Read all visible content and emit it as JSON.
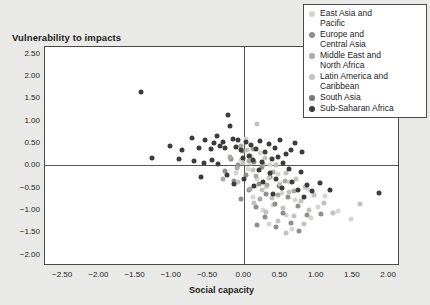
{
  "chart_data": {
    "type": "scatter",
    "title": "Vulnerability to impacts",
    "xlabel": "Social capacity",
    "ylabel": "Vulnerability to impacts",
    "xlim": [
      -2.75,
      2.15
    ],
    "ylim": [
      -2.25,
      2.65
    ],
    "xticks": [
      "-2.50",
      "-2.00",
      "-1.50",
      "-1.00",
      "-0.50",
      "0.00",
      "0.50",
      "1.00",
      "1.50",
      "2.00"
    ],
    "xtick_values": [
      -2.5,
      -2.0,
      -1.5,
      -1.0,
      -0.5,
      0.0,
      0.5,
      1.0,
      1.5,
      2.0
    ],
    "yticks": [
      "2.50",
      "2.00",
      "1.50",
      "1.00",
      "0.50",
      "0.00",
      "-0.50",
      "-1.00",
      "-1.50",
      "-2.00"
    ],
    "ytick_values": [
      2.5,
      2.0,
      1.5,
      1.0,
      0.5,
      0.0,
      -0.5,
      -1.0,
      -1.5,
      -2.0
    ],
    "grid": false,
    "zero_lines": true,
    "legend_position": "top-right",
    "series": [
      {
        "name": "East Asia and Pacific",
        "color": "#d5d5d3",
        "points": [
          [
            0.02,
            0.6
          ],
          [
            0.22,
            0.28
          ],
          [
            -0.05,
            0.12
          ],
          [
            0.1,
            0.05
          ],
          [
            0.35,
            0.02
          ],
          [
            0.05,
            -0.08
          ],
          [
            -0.12,
            -0.18
          ],
          [
            0.46,
            -0.2
          ],
          [
            0.18,
            -0.3
          ],
          [
            0.62,
            -0.38
          ],
          [
            0.3,
            -0.48
          ],
          [
            0.88,
            -0.52
          ],
          [
            0.52,
            -0.62
          ],
          [
            0.12,
            -0.7
          ],
          [
            0.7,
            -0.78
          ],
          [
            0.4,
            -0.88
          ],
          [
            1.02,
            -0.92
          ],
          [
            0.26,
            -1.0
          ],
          [
            0.58,
            -1.1
          ],
          [
            0.92,
            -1.18
          ],
          [
            1.3,
            -1.02
          ],
          [
            0.34,
            -1.3
          ],
          [
            0.66,
            -1.42
          ],
          [
            1.12,
            -0.68
          ],
          [
            1.48,
            -1.2
          ]
        ]
      },
      {
        "name": "Europe and Central Asia",
        "color": "#8e8e8c",
        "points": [
          [
            -0.02,
            0.32
          ],
          [
            0.08,
            0.22
          ],
          [
            -0.18,
            0.14
          ],
          [
            0.14,
            0.08
          ],
          [
            -0.08,
            0.0
          ],
          [
            0.24,
            -0.04
          ],
          [
            -0.26,
            -0.12
          ],
          [
            0.02,
            -0.22
          ],
          [
            0.36,
            -0.26
          ],
          [
            -0.14,
            -0.34
          ],
          [
            0.2,
            -0.42
          ],
          [
            0.48,
            -0.46
          ],
          [
            0.06,
            -0.56
          ],
          [
            0.3,
            -0.64
          ],
          [
            -0.05,
            -0.74
          ],
          [
            0.6,
            -0.7
          ],
          [
            0.42,
            -0.86
          ],
          [
            0.16,
            -0.94
          ],
          [
            0.74,
            -0.9
          ],
          [
            0.54,
            -1.06
          ],
          [
            0.28,
            -1.16
          ],
          [
            0.86,
            -1.12
          ],
          [
            0.64,
            -1.28
          ],
          [
            0.44,
            -1.38
          ],
          [
            1.06,
            -1.08
          ],
          [
            0.76,
            -1.46
          ],
          [
            0.18,
            -1.34
          ]
        ]
      },
      {
        "name": "Middle East and North Africa",
        "color": "#a9a9a7",
        "points": [
          [
            -0.04,
            0.44
          ],
          [
            0.12,
            0.36
          ],
          [
            -0.2,
            0.2
          ],
          [
            0.06,
            0.1
          ],
          [
            0.26,
            0.04
          ],
          [
            -0.1,
            -0.06
          ],
          [
            0.4,
            -0.14
          ],
          [
            0.16,
            -0.24
          ],
          [
            -0.3,
            -0.3
          ],
          [
            0.56,
            -0.34
          ],
          [
            0.32,
            -0.44
          ],
          [
            0.08,
            -0.52
          ],
          [
            0.68,
            -0.58
          ],
          [
            0.46,
            -0.66
          ],
          [
            0.22,
            -0.76
          ]
        ]
      },
      {
        "name": "Latin America and Caribbean",
        "color": "#c2c2c0",
        "points": [
          [
            0.18,
            0.92
          ],
          [
            0.04,
            0.34
          ],
          [
            0.28,
            0.16
          ],
          [
            -0.02,
            0.06
          ],
          [
            0.44,
            0.0
          ],
          [
            0.12,
            -0.1
          ],
          [
            0.58,
            -0.16
          ],
          [
            0.34,
            -0.28
          ],
          [
            -0.08,
            -0.36
          ],
          [
            0.72,
            -0.3
          ],
          [
            0.5,
            -0.42
          ],
          [
            0.24,
            -0.54
          ],
          [
            0.84,
            -0.48
          ],
          [
            0.62,
            -0.6
          ],
          [
            0.38,
            -0.72
          ],
          [
            0.96,
            -0.66
          ],
          [
            0.14,
            -0.84
          ],
          [
            0.78,
            -0.8
          ],
          [
            0.54,
            -0.96
          ],
          [
            1.1,
            -0.84
          ],
          [
            0.3,
            -1.04
          ],
          [
            0.9,
            -1.0
          ],
          [
            0.68,
            -1.14
          ],
          [
            0.46,
            -1.24
          ],
          [
            1.22,
            -1.06
          ],
          [
            0.82,
            -1.32
          ],
          [
            1.6,
            -0.86
          ],
          [
            0.58,
            -1.52
          ]
        ]
      },
      {
        "name": "South Asia",
        "color": "#757573"
      },
      {
        "name": "Sub-Saharan Africa",
        "color": "#3c3c3a",
        "points": [
          [
            -1.42,
            1.64
          ],
          [
            -0.22,
            1.12
          ],
          [
            -0.2,
            0.88
          ],
          [
            -0.72,
            0.62
          ],
          [
            -0.54,
            0.58
          ],
          [
            -0.38,
            0.66
          ],
          [
            -0.3,
            0.52
          ],
          [
            -0.42,
            0.5
          ],
          [
            -1.02,
            0.44
          ],
          [
            -0.86,
            0.34
          ],
          [
            -0.16,
            0.6
          ],
          [
            -0.08,
            0.56
          ],
          [
            0.02,
            0.52
          ],
          [
            -0.26,
            0.4
          ],
          [
            -0.34,
            0.44
          ],
          [
            -0.46,
            0.36
          ],
          [
            -0.62,
            0.4
          ],
          [
            -0.12,
            0.42
          ],
          [
            0.1,
            0.46
          ],
          [
            0.22,
            0.54
          ],
          [
            -0.04,
            0.34
          ],
          [
            0.16,
            0.36
          ],
          [
            0.34,
            0.48
          ],
          [
            0.42,
            0.4
          ],
          [
            0.28,
            0.3
          ],
          [
            -0.7,
            0.1
          ],
          [
            -0.56,
            0.06
          ],
          [
            -0.9,
            0.14
          ],
          [
            -1.28,
            0.16
          ],
          [
            -0.44,
            0.12
          ],
          [
            -0.36,
            0.04
          ],
          [
            -0.6,
            -0.26
          ],
          [
            -0.24,
            -0.22
          ],
          [
            0.06,
            0.22
          ],
          [
            0.5,
            0.58
          ],
          [
            0.58,
            0.26
          ],
          [
            0.46,
            0.18
          ],
          [
            0.64,
            0.34
          ],
          [
            0.7,
            0.5
          ],
          [
            0.8,
            0.3
          ],
          [
            0.12,
            0.12
          ],
          [
            -0.02,
            0.16
          ],
          [
            0.24,
            0.08
          ],
          [
            0.38,
            0.14
          ],
          [
            0.54,
            0.06
          ],
          [
            0.2,
            -0.1
          ],
          [
            0.36,
            -0.18
          ],
          [
            0.62,
            -0.08
          ],
          [
            0.78,
            -0.14
          ],
          [
            0.44,
            -0.3
          ],
          [
            0.26,
            -0.38
          ],
          [
            0.66,
            -0.36
          ],
          [
            0.52,
            -0.5
          ],
          [
            0.86,
            -0.44
          ],
          [
            0.74,
            -0.56
          ],
          [
            1.04,
            -0.4
          ],
          [
            0.94,
            -0.58
          ],
          [
            1.18,
            -0.54
          ],
          [
            0.82,
            -0.7
          ],
          [
            1.86,
            -0.62
          ],
          [
            0.4,
            -0.64
          ],
          [
            0.14,
            -0.46
          ],
          [
            -0.14,
            -0.42
          ],
          [
            0.0,
            -0.3
          ]
        ]
      }
    ]
  }
}
